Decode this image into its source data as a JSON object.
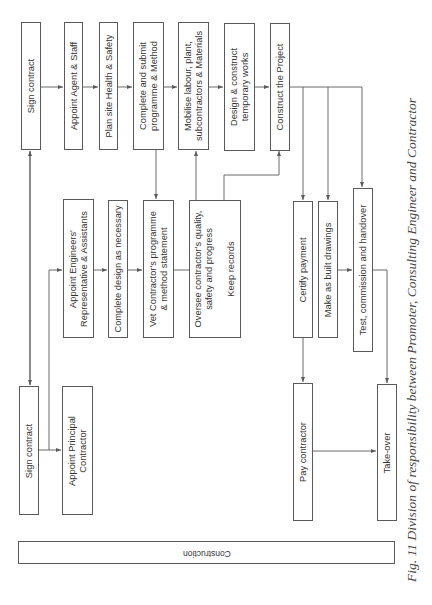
{
  "diagram": {
    "title_bar": "Construction",
    "caption": "Fig. 11  Division of responsibility between Promoter, Consulting Engineer and Contractor",
    "contractor_row": [
      {
        "id": "c-sign",
        "label": "Sign contract"
      },
      {
        "id": "c-agent",
        "label": "Appoint Agent & Staff"
      },
      {
        "id": "c-hs",
        "label": "Plan site Health & Safety"
      },
      {
        "id": "c-programme",
        "label": "Complete and submit\nprogramme & Method"
      },
      {
        "id": "c-mobilise",
        "label": "Mobilise labour, plant,\nsubcontractors & Materials"
      },
      {
        "id": "c-temp",
        "label": "Design & construct\ntemporary works"
      },
      {
        "id": "c-construct",
        "label": "Construct the Project"
      }
    ],
    "engineer_row": [
      {
        "id": "e-appoint",
        "label": "Appoint Engineers'\nRepresentative & Assistants"
      },
      {
        "id": "e-design",
        "label": "Complete design as necessary"
      },
      {
        "id": "e-vet",
        "label": "Vet Contractor's programme\n& method statement"
      },
      {
        "id": "e-oversee",
        "label": "Oversee contractor's quality,\nsafety and progress\n\nKeep records"
      },
      {
        "id": "e-certify",
        "label": "Certify payment"
      },
      {
        "id": "e-asbuilt",
        "label": "Make as built drawings"
      },
      {
        "id": "e-test",
        "label": "Test, commission and handover"
      }
    ],
    "promoter_row": [
      {
        "id": "p-sign",
        "label": "Sign contract"
      },
      {
        "id": "p-appoint",
        "label": "Appoint Principal\nContractor"
      },
      {
        "id": "p-pay",
        "label": "Pay contractor"
      },
      {
        "id": "p-takeover",
        "label": "Take-over"
      }
    ],
    "colors": {
      "line": "#5a5a5a",
      "text": "#333333",
      "background": "#ffffff"
    }
  }
}
